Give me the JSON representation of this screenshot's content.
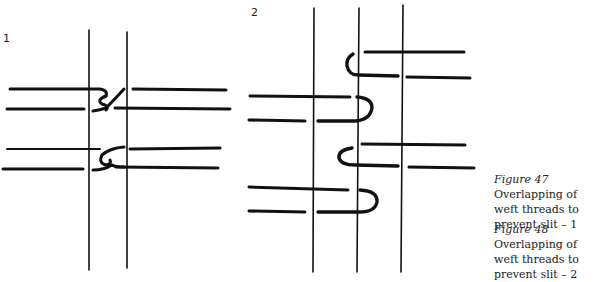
{
  "figures": [
    {
      "label": "1",
      "caption_prefix": "Figure 47",
      "caption_text": "Overlap­ping of weft threads to prevent slit – 1"
    },
    {
      "label": "2",
      "caption_prefix": "Figure 48",
      "caption_text": "Overlap­ping of weft threads to prevent slit – 2"
    }
  ],
  "colors": {
    "ink": "#111111",
    "paper": "#ffffff"
  }
}
